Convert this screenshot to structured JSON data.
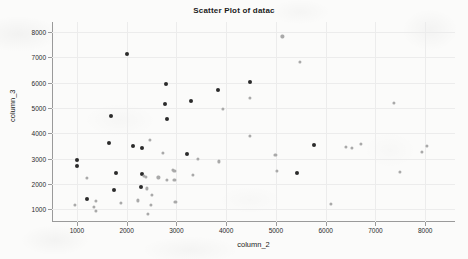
{
  "chart_data": {
    "type": "scatter",
    "title": "Scatter Plot of datac",
    "xlabel": "column_2",
    "ylabel": "column_3",
    "xlim": [
      500,
      8600
    ],
    "ylim": [
      500,
      8400
    ],
    "xticks": [
      1000,
      2000,
      3000,
      4000,
      5000,
      6000,
      7000,
      8000
    ],
    "yticks": [
      1000,
      2000,
      3000,
      4000,
      5000,
      6000,
      7000,
      8000
    ],
    "grid": true,
    "legend": null,
    "marker": "filled-circle",
    "series": [
      {
        "name": "dark-points",
        "color": "#2b2b2b",
        "marker_size": 4,
        "points": [
          [
            2000,
            7120
          ],
          [
            2800,
            5960
          ],
          [
            4470,
            6030
          ],
          [
            3840,
            5700
          ],
          [
            3290,
            5280
          ],
          [
            2780,
            5160
          ],
          [
            1690,
            4700
          ],
          [
            2810,
            4580
          ],
          [
            1640,
            3620
          ],
          [
            2120,
            3520
          ],
          [
            5770,
            3550
          ],
          [
            2300,
            3440
          ],
          [
            3220,
            3180
          ],
          [
            1000,
            2950
          ],
          [
            1010,
            2710
          ],
          [
            1790,
            2420
          ],
          [
            5420,
            2430
          ],
          [
            2310,
            2390
          ],
          [
            2280,
            1890
          ],
          [
            1750,
            1780
          ],
          [
            1210,
            1410
          ]
        ]
      },
      {
        "name": "light-points",
        "color": "#a9a9a9",
        "marker_size": 3.2,
        "points": [
          [
            5130,
            7830
          ],
          [
            5480,
            6830
          ],
          [
            4480,
            5410
          ],
          [
            3930,
            4980
          ],
          [
            7380,
            5200
          ],
          [
            4470,
            3890
          ],
          [
            2460,
            3740
          ],
          [
            6400,
            3480
          ],
          [
            6520,
            3420
          ],
          [
            6710,
            3580
          ],
          [
            8030,
            3520
          ],
          [
            7930,
            3260
          ],
          [
            2730,
            3220
          ],
          [
            4990,
            3150
          ],
          [
            3430,
            2980
          ],
          [
            3860,
            2890
          ],
          [
            5020,
            2520
          ],
          [
            7500,
            2480
          ],
          [
            1200,
            2250
          ],
          [
            2350,
            2310
          ],
          [
            2380,
            2290
          ],
          [
            2930,
            2560
          ],
          [
            2960,
            2510
          ],
          [
            2960,
            2150
          ],
          [
            2810,
            2160
          ],
          [
            2640,
            2260
          ],
          [
            3340,
            2370
          ],
          [
            2400,
            1830
          ],
          [
            2500,
            1560
          ],
          [
            1380,
            1340
          ],
          [
            2230,
            1350
          ],
          [
            2980,
            1300
          ],
          [
            1880,
            1250
          ],
          [
            2480,
            1160
          ],
          [
            965,
            1170
          ],
          [
            1350,
            1090
          ],
          [
            1390,
            935
          ],
          [
            2420,
            830
          ],
          [
            6110,
            1210
          ]
        ]
      }
    ]
  }
}
